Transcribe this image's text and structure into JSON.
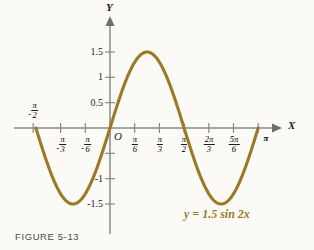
{
  "figure": {
    "caption": "FIGURE 5-13",
    "equation_label": "y = 1.5 sin 2x",
    "curve_color": "#9c7a25",
    "axis_color": "#8a8a88",
    "background_color": "#fbfaf7"
  },
  "axes": {
    "x_axis_name": "X",
    "y_axis_name": "Y",
    "origin_label": "O"
  },
  "chart_data": {
    "type": "line",
    "title": "FIGURE 5-13",
    "annotations": [
      "y = 1.5 sin 2x"
    ],
    "function": "y = 1.5 sin 2x",
    "amplitude": 1.5,
    "period": "pi",
    "xlabel": "X",
    "ylabel": "Y",
    "xlim": [
      -1.5707963,
      3.1415927
    ],
    "ylim": [
      -1.75,
      1.75
    ],
    "grid": false,
    "legend": "none",
    "x_tick_labels": [
      "-π/2",
      "-π/3",
      "-π/6",
      "O",
      "π/6",
      "π/3",
      "π/2",
      "2π/3",
      "5π/6",
      "π"
    ],
    "x_tick_values": [
      -1.5708,
      -1.0472,
      -0.5236,
      0,
      0.5236,
      1.0472,
      1.5708,
      2.0944,
      2.618,
      3.1416
    ],
    "y_tick_labels": [
      "1.5",
      "1",
      "0.5",
      "-0.5",
      "-1",
      "-1.5"
    ],
    "y_tick_values": [
      1.5,
      1,
      0.5,
      -0.5,
      -1,
      -1.5
    ],
    "y_tick_labels_shown": [
      "1.5",
      "1",
      "0.5",
      "-1",
      "-1.5"
    ],
    "x": [
      -1.5708,
      -1.4399,
      -1.309,
      -1.1781,
      -1.0472,
      -0.9163,
      -0.7854,
      -0.6545,
      -0.5236,
      -0.3927,
      -0.2618,
      -0.1309,
      0,
      0.1309,
      0.2618,
      0.3927,
      0.5236,
      0.6545,
      0.7854,
      0.9163,
      1.0472,
      1.1781,
      1.309,
      1.4399,
      1.5708,
      1.7017,
      1.8326,
      1.9635,
      2.0944,
      2.2253,
      2.3562,
      2.4871,
      2.618,
      2.7489,
      2.8798,
      3.0107,
      3.1416
    ],
    "y": [
      0,
      -0.388,
      -0.75,
      -1.061,
      -1.299,
      -1.449,
      -1.5,
      -1.449,
      -1.299,
      -1.061,
      -0.75,
      -0.388,
      0,
      0.388,
      0.75,
      1.061,
      1.299,
      1.449,
      1.5,
      1.449,
      1.299,
      1.061,
      0.75,
      0.388,
      0,
      -0.388,
      -0.75,
      -1.061,
      -1.299,
      -1.449,
      -1.5,
      -1.449,
      -1.299,
      -1.061,
      -0.75,
      -0.388,
      0
    ],
    "maxima": [
      {
        "x": 0.7854,
        "y": 1.5
      }
    ],
    "minima": [
      {
        "x": -0.7854,
        "y": -1.5
      },
      {
        "x": 2.3562,
        "y": -1.5
      }
    ],
    "zeros": [
      -1.5708,
      0,
      1.5708,
      3.1416
    ]
  },
  "ticks": {
    "y_labels": [
      {
        "text": "1.5"
      },
      {
        "text": "1"
      },
      {
        "text": "0.5"
      },
      {
        "text": "-1"
      },
      {
        "text": "-1.5"
      }
    ],
    "x_labels": [
      {
        "sign": "-",
        "num": "π",
        "den": "2"
      },
      {
        "sign": "-",
        "num": "π",
        "den": "3"
      },
      {
        "sign": "-",
        "num": "π",
        "den": "6"
      },
      {
        "sign": "",
        "num": "π",
        "den": "6"
      },
      {
        "sign": "",
        "num": "π",
        "den": "3"
      },
      {
        "sign": "",
        "num": "π",
        "den": "2"
      },
      {
        "sign": "",
        "num": "2π",
        "den": "3"
      },
      {
        "sign": "",
        "num": "5π",
        "den": "6"
      },
      {
        "sign": "",
        "text": "π"
      }
    ]
  }
}
